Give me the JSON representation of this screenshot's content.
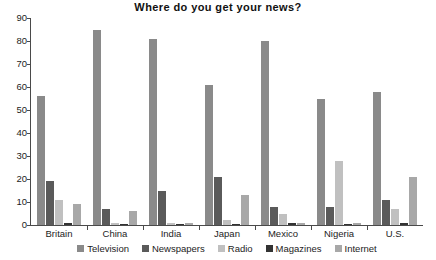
{
  "chart_data": {
    "type": "bar",
    "title": "Where do you get your news?",
    "xlabel": "",
    "ylabel": "",
    "ylim": [
      0,
      90
    ],
    "yticks": [
      0,
      10,
      20,
      30,
      40,
      50,
      60,
      70,
      80,
      90
    ],
    "grid": false,
    "legend_position": "bottom",
    "categories": [
      "Britain",
      "China",
      "India",
      "Japan",
      "Mexico",
      "Nigeria",
      "U.S."
    ],
    "series": [
      {
        "name": "Television",
        "color": "#8a8a8a",
        "values": [
          56,
          85,
          81,
          61,
          80,
          55,
          58
        ]
      },
      {
        "name": "Newspapers",
        "color": "#5a5a5a",
        "values": [
          19,
          7,
          15,
          21,
          8,
          8,
          11
        ]
      },
      {
        "name": "Radio",
        "color": "#c0c0c0",
        "values": [
          11,
          1,
          1,
          2,
          5,
          28,
          7
        ]
      },
      {
        "name": "Magazines",
        "color": "#333333",
        "values": [
          1,
          0,
          0,
          0,
          1,
          0,
          1
        ]
      },
      {
        "name": "Internet",
        "color": "#a8a8a8",
        "values": [
          9,
          6,
          1,
          13,
          1,
          1,
          21
        ]
      }
    ]
  }
}
